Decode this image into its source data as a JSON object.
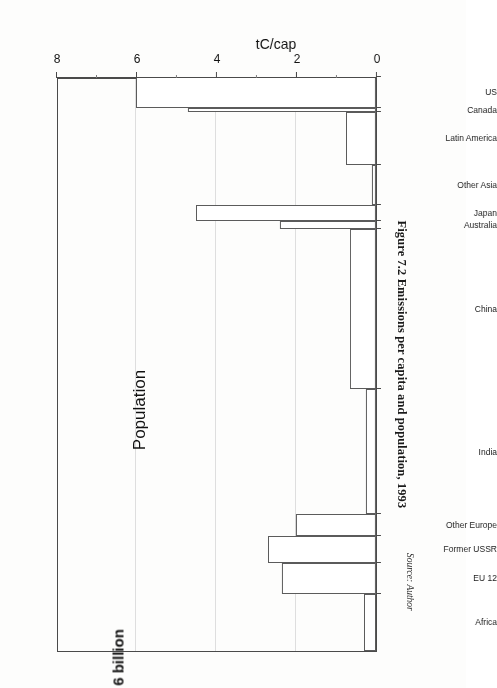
{
  "figure": {
    "title": "Figure 7.2 Emissions per capita and population, 1993",
    "source": "Source: Author"
  },
  "axes": {
    "value_axis_title": "tC/cap",
    "value_ticks": [
      "0",
      "2",
      "4",
      "6",
      "8"
    ],
    "category_axis_title": "Population",
    "category_axis_total": "6 billion"
  },
  "chart_data": {
    "type": "bar",
    "title": "Figure 7.2 Emissions per capita and population, 1993",
    "xlabel": "Population",
    "ylabel": "tC/cap",
    "orientation": "horizontal",
    "note": "Staircase / Kaya-style chart: bar length = emissions per capita (tC/cap); bar width = population share, cumulative width spans 6 billion.",
    "ylim": [
      0,
      8
    ],
    "grid": true,
    "categories": [
      "Africa",
      "EU 12",
      "Former USSR",
      "Other Europe",
      "India",
      "China",
      "Australia",
      "Japan",
      "Other Asia",
      "Latin America",
      "Canada",
      "US"
    ],
    "values": [
      0.3,
      2.35,
      2.7,
      2.0,
      0.25,
      0.65,
      2.4,
      4.5,
      0.1,
      0.75,
      4.7,
      6.0
    ],
    "widths": [
      0.78,
      0.42,
      0.36,
      0.3,
      1.7,
      2.18,
      0.1,
      0.22,
      0.55,
      0.72,
      0.05,
      0.42
    ],
    "series": [
      {
        "name": "tC/cap",
        "values": [
          0.3,
          2.35,
          2.7,
          2.0,
          0.25,
          0.65,
          2.4,
          4.5,
          0.1,
          0.75,
          4.7,
          6.0
        ]
      }
    ],
    "gridlines": [
      2,
      4,
      6
    ]
  },
  "bars": [
    {
      "label": "Africa",
      "value": 0.3,
      "width": 0.78
    },
    {
      "label": "EU 12",
      "value": 2.35,
      "width": 0.42
    },
    {
      "label": "Former USSR",
      "value": 2.7,
      "width": 0.36
    },
    {
      "label": "Other Europe",
      "value": 2.0,
      "width": 0.3
    },
    {
      "label": "India",
      "value": 0.25,
      "width": 1.7
    },
    {
      "label": "China",
      "value": 0.65,
      "width": 2.18
    },
    {
      "label": "Australia",
      "value": 2.4,
      "width": 0.1
    },
    {
      "label": "Japan",
      "value": 4.5,
      "width": 0.22
    },
    {
      "label": "Other Asia",
      "value": 0.1,
      "width": 0.55
    },
    {
      "label": "Latin America",
      "value": 0.75,
      "width": 0.72
    },
    {
      "label": "Canada",
      "value": 4.7,
      "width": 0.05
    },
    {
      "label": "US",
      "value": 6.0,
      "width": 0.42
    }
  ]
}
